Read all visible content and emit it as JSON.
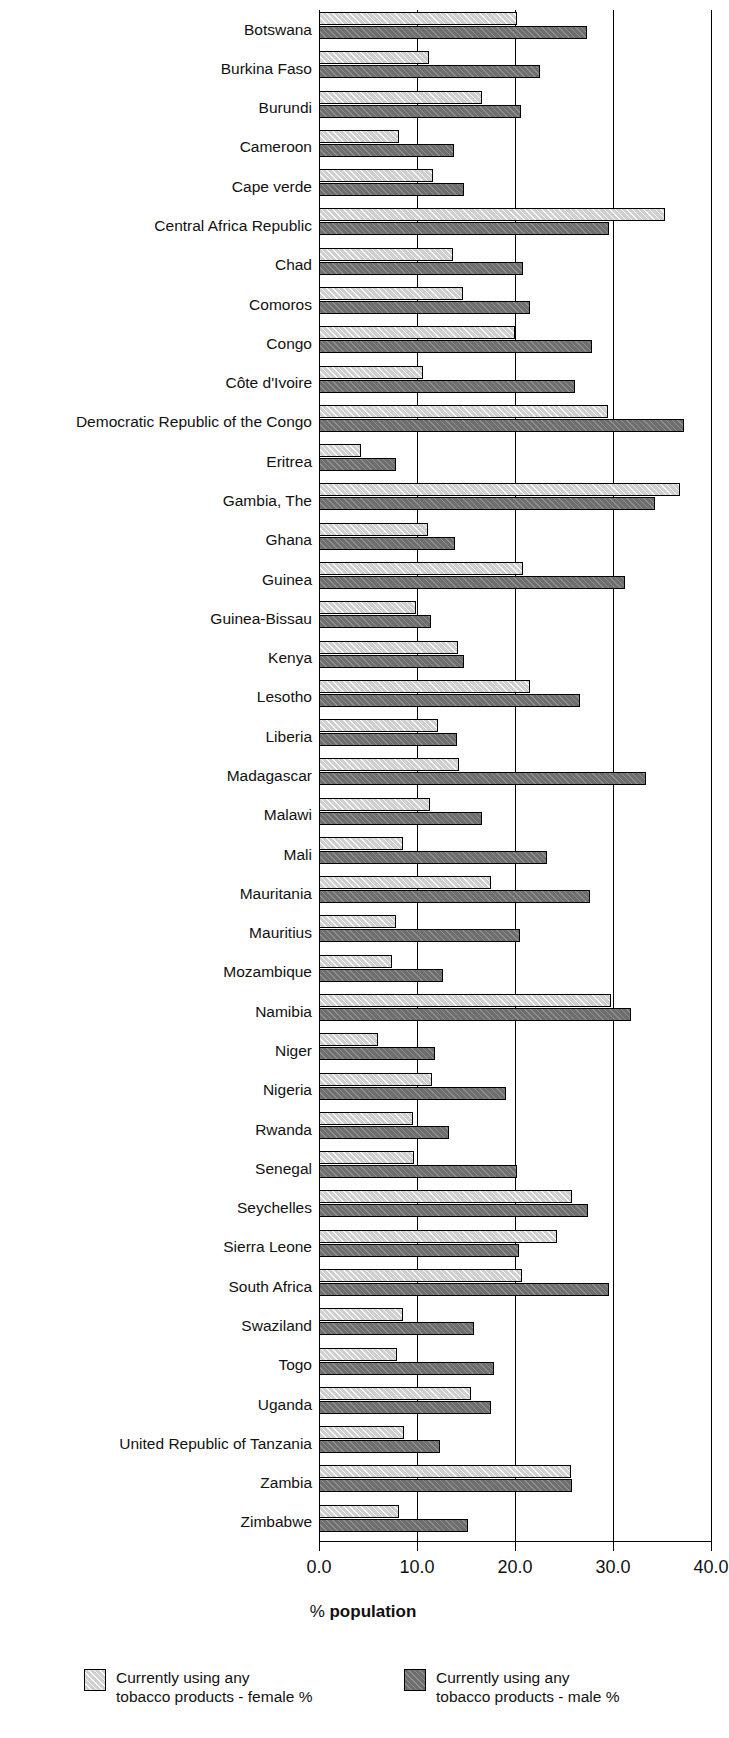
{
  "chart_data": {
    "type": "bar",
    "orientation": "horizontal",
    "title": "",
    "xlabel": "% population",
    "ylabel": "",
    "xlim": [
      0.0,
      40.0
    ],
    "xticks": [
      "0.0",
      "10.0",
      "20.0",
      "30.0",
      "40.0"
    ],
    "xtick_values": [
      0,
      10,
      20,
      30,
      40
    ],
    "grid": true,
    "legend_position": "bottom",
    "categories": [
      "Botswana",
      "Burkina Faso",
      "Burundi",
      "Cameroon",
      "Cape verde",
      "Central Africa Republic",
      "Chad",
      "Comoros",
      "Congo",
      "Côte d'Ivoire",
      "Democratic Republic of the Congo",
      "Eritrea",
      "Gambia, The",
      "Ghana",
      "Guinea",
      "Guinea-Bissau",
      "Kenya",
      "Lesotho",
      "Liberia",
      "Madagascar",
      "Malawi",
      "Mali",
      "Mauritania",
      "Mauritius",
      "Mozambique",
      "Namibia",
      "Niger",
      "Nigeria",
      "Rwanda",
      "Senegal",
      "Seychelles",
      "Sierra Leone",
      "South Africa",
      "Swaziland",
      "Togo",
      "Uganda",
      "United Republic of Tanzania",
      "Zambia",
      "Zimbabwe"
    ],
    "series": [
      {
        "name": "Currently using any tobacco products - female %",
        "color": "#cfcfcf",
        "values": [
          20.2,
          11.2,
          16.6,
          8.2,
          11.6,
          35.3,
          13.7,
          14.7,
          20.0,
          10.6,
          29.5,
          4.3,
          36.8,
          11.1,
          20.8,
          9.9,
          14.2,
          21.5,
          12.1,
          14.3,
          11.3,
          8.6,
          17.6,
          7.9,
          7.4,
          29.8,
          6.0,
          11.5,
          9.6,
          9.7,
          25.8,
          24.3,
          20.7,
          8.6,
          8.0,
          15.5,
          8.7,
          25.7,
          8.2
        ]
      },
      {
        "name": "Currently using any tobacco products - male %",
        "color": "#6e6e6e",
        "values": [
          27.3,
          22.6,
          20.6,
          13.8,
          14.8,
          29.6,
          20.8,
          21.5,
          27.9,
          26.1,
          37.2,
          7.9,
          34.3,
          13.9,
          31.2,
          11.4,
          14.8,
          26.6,
          14.1,
          33.4,
          16.6,
          23.3,
          27.7,
          20.5,
          12.7,
          31.8,
          11.8,
          19.1,
          13.3,
          20.2,
          27.4,
          20.4,
          29.6,
          15.8,
          17.9,
          17.5,
          12.3,
          25.8,
          15.2
        ]
      }
    ]
  },
  "axis_title": {
    "prefix": "% ",
    "emphasis": "population"
  },
  "legend": {
    "items": [
      {
        "swatch": "female-swatch",
        "label": "Currently using any\ntobacco products - female %"
      },
      {
        "swatch": "male-swatch",
        "label": "Currently using any\ntobacco products - male %"
      }
    ]
  }
}
